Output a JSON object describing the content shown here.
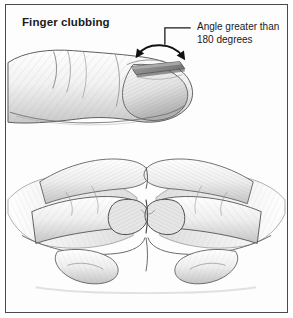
{
  "figure": {
    "title": "Finger clubbing",
    "annotation": {
      "line1": "Angle greater than",
      "line2": "180 degrees"
    },
    "colors": {
      "border": "#4a4a4a",
      "background": "#fdfdfd",
      "ink": "#1a1a1a",
      "nail_plate": "#8a8a8a",
      "shading": "#9a9a9a"
    },
    "illustrations": [
      {
        "name": "lateral-clubbed-finger",
        "description": "Side profile pencil drawing of a clubbed finger with bulbous distal phalanx and raised gray nail plate"
      },
      {
        "name": "schamroth-window-test",
        "description": "Two hands with index fingernails opposed, showing obliteration of the normal diamond shaped window"
      }
    ],
    "leader": {
      "name": "angle-leader-line",
      "description": "L shaped pointer from annotation text down to curved double headed arrow over the nail"
    }
  }
}
